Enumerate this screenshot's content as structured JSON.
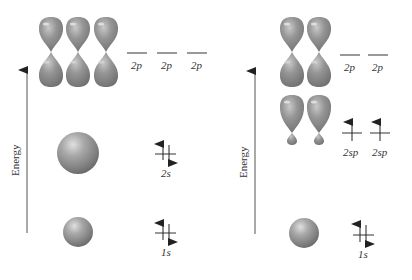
{
  "colors": {
    "orbital": "#8a8a8a",
    "orbital_light": "#c8c8c8",
    "orbital_dark": "#5e5e5e",
    "level_line": "#777777",
    "arrow": "#222222",
    "axis": "#555555",
    "text": "#333333"
  },
  "left_panel": {
    "axis_label": "Energy",
    "levels": {
      "p": {
        "labels": [
          "2p",
          "2p",
          "2p"
        ],
        "electrons": [
          0,
          0,
          0
        ]
      },
      "s2": {
        "label": "2s",
        "electrons": 2
      },
      "s1": {
        "label": "1s",
        "electrons": 2
      }
    },
    "orbitals": [
      "p-orbital",
      "p-orbital",
      "p-orbital",
      "2s-sphere",
      "1s-sphere"
    ]
  },
  "right_panel": {
    "axis_label": "Energy",
    "levels": {
      "p": {
        "labels": [
          "2p",
          "2p"
        ],
        "electrons": [
          0,
          0
        ]
      },
      "sp": {
        "labels": [
          "2sp",
          "2sp"
        ],
        "electrons": [
          1,
          1
        ]
      },
      "s1": {
        "label": "1s",
        "electrons": 2
      }
    },
    "orbitals": [
      "p-orbital",
      "p-orbital",
      "sp-hybrid-orbital",
      "sp-hybrid-orbital",
      "1s-sphere"
    ]
  }
}
